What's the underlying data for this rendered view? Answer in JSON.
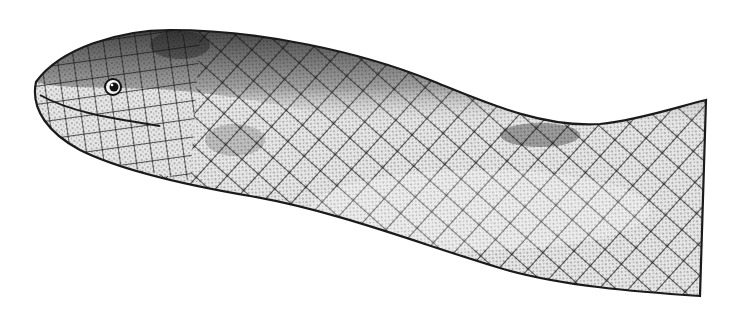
{
  "image": {
    "subject": "snake-head-illustration",
    "style": "black-and-white stippled scientific drawing",
    "colors": {
      "background": "#ffffff",
      "ink": "#1a1a1a",
      "light_scale": "#e4e4e4",
      "mid_scale": "#bdbdbd",
      "dark_dorsal": "#3a3a3a"
    }
  }
}
